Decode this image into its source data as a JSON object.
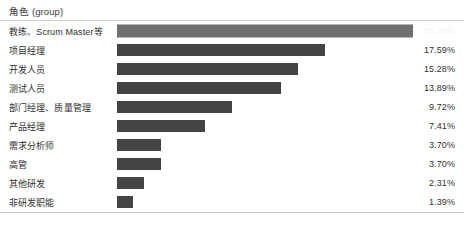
{
  "header": {
    "title": "角色 (group)"
  },
  "chart_data": {
    "type": "bar",
    "orientation": "horizontal",
    "title": "角色 (group)",
    "xlabel": "",
    "ylabel": "",
    "value_suffix": "%",
    "grid": false,
    "legend": "none",
    "xlim": [
      0,
      25
    ],
    "categories": [
      "教练、Scrum Master等",
      "项目经理",
      "开发人员",
      "测试人员",
      "部门经理、质量管理",
      "产品经理",
      "需求分析师",
      "高管",
      "其他研发",
      "非研发职能"
    ],
    "values": [
      25.0,
      17.59,
      15.28,
      13.89,
      9.72,
      7.41,
      3.7,
      3.7,
      2.31,
      1.39
    ],
    "value_labels": [
      "25.00%",
      "17.59%",
      "15.28%",
      "13.89%",
      "9.72%",
      "7.41%",
      "3.70%",
      "3.70%",
      "2.31%",
      "1.39%"
    ],
    "highlighted_index": 0,
    "colors": {
      "bar": "#444444",
      "bar_highlight": "#6f6f6f",
      "label_text": "#2f2f2f",
      "value_on_bar_text": "#f2f2f2",
      "rule": "#d0d0d0",
      "background": "#ffffff"
    }
  }
}
